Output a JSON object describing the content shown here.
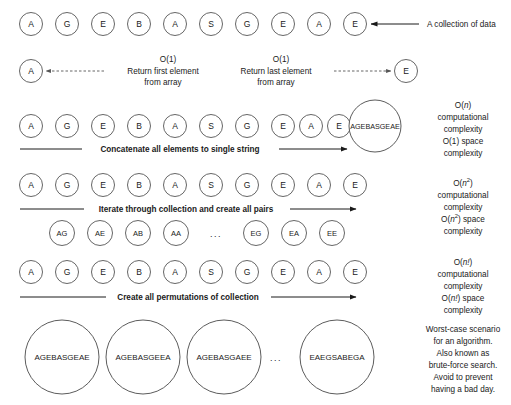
{
  "collection": {
    "elements": [
      "A",
      "G",
      "E",
      "B",
      "A",
      "S",
      "G",
      "E",
      "A",
      "E"
    ],
    "caption": "A collection of data"
  },
  "row_first_last": {
    "first_element": "A",
    "last_element": "E",
    "first_complexity": "O(1)",
    "first_label_line1": "Return first element",
    "first_label_line2": "from array",
    "last_complexity": "O(1)",
    "last_label_line1": "Return last element",
    "last_label_line2": "from array"
  },
  "row_concat": {
    "elements": [
      "A",
      "G",
      "E",
      "B",
      "A",
      "S",
      "G",
      "E",
      "A",
      "E"
    ],
    "arrow_label": "Concatenate all elements to single string",
    "result_string": "AGEBASGEAE",
    "complexity": {
      "line1_prefix": "O(",
      "line1_var": "n",
      "line1_suffix": ")",
      "line2": "computational",
      "line3": "complexity",
      "line4": "O(1) space",
      "line5": "complexity"
    }
  },
  "row_pairs": {
    "elements": [
      "A",
      "G",
      "E",
      "B",
      "A",
      "S",
      "G",
      "E",
      "A",
      "E"
    ],
    "arrow_label": "Iterate through collection and create all pairs",
    "pairs_left": [
      "AG",
      "AE",
      "AB",
      "AA"
    ],
    "pairs_ellipsis": "...",
    "pairs_right": [
      "EG",
      "EA",
      "EE"
    ],
    "complexity": {
      "line1_prefix": "O(",
      "line1_var": "n",
      "line1_sup": "2",
      "line1_suffix": ")",
      "line2": "computational",
      "line3": "complexity",
      "line4_prefix": "O(",
      "line4_var": "n",
      "line4_sup": "2",
      "line4_suffix": ") space",
      "line5": "complexity"
    }
  },
  "row_permutations": {
    "elements": [
      "A",
      "G",
      "E",
      "B",
      "A",
      "S",
      "G",
      "E",
      "A",
      "E"
    ],
    "arrow_label": "Create all permutations of collection",
    "complexity": {
      "line1_prefix": "O(",
      "line1_var": "n!",
      "line1_suffix": ")",
      "line2": "computational",
      "line3": "complexity",
      "line4_prefix": "O(",
      "line4_var": "n!",
      "line4_suffix": ") space",
      "line5": "complexity"
    }
  },
  "row_results": {
    "permutations": [
      "AGEBASGEAE",
      "AGEBASGEEA",
      "AGEBASGAEE"
    ],
    "ellipsis": "...",
    "last_permutation": "EAEGSABEGA",
    "note": {
      "line1": "Worst-case scenario",
      "line2": "for an algorithm.",
      "line3": "Also known as",
      "line4": "brute-force search.",
      "line5": "Avoid to prevent",
      "line6": "having a bad day."
    }
  },
  "colors": {
    "node_stroke": "#555555",
    "text": "#1a1a1a",
    "arrow": "#1a1a1a",
    "background": "#ffffff"
  }
}
